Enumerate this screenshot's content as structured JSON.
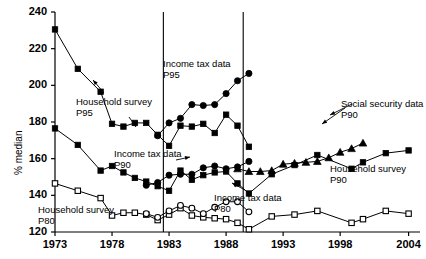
{
  "chart_data": {
    "type": "line",
    "title": "",
    "xlabel": "",
    "ylabel": "% median",
    "xlim": [
      1973,
      2005
    ],
    "ylim": [
      120,
      240
    ],
    "ytick_values": [
      120,
      140,
      160,
      180,
      200,
      220,
      240
    ],
    "ytick_labels": [
      "120",
      "140",
      "160",
      "180",
      "200",
      "220",
      "240"
    ],
    "xtick_values": [
      1973,
      1978,
      1983,
      1988,
      1993,
      1998,
      2004
    ],
    "xtick_labels": [
      "1973",
      "1978",
      "1983",
      "1988",
      "1993",
      "1998",
      "2004"
    ],
    "grid": false,
    "legend_position": "inline-annotations",
    "vertical_reference_lines": [
      1982.5,
      1989.5
    ],
    "series": [
      {
        "name": "Household survey P95",
        "marker": "filled-square",
        "x": [
          1973,
          1975,
          1977,
          1978,
          1979,
          1980,
          1981,
          1982,
          1983,
          1984,
          1985,
          1986,
          1987,
          1988,
          1989,
          1990
        ],
        "values": [
          230.5,
          209.0,
          196.5,
          179.0,
          177.5,
          179.5,
          179.5,
          173.0,
          167.0,
          178.0,
          177.5,
          179.0,
          174.0,
          184.0,
          178.0,
          166.5
        ]
      },
      {
        "name": "Income tax data P95",
        "marker": "filled-circle",
        "x": [
          1982,
          1983,
          1984,
          1985,
          1986,
          1987,
          1988,
          1989,
          1990
        ],
        "values": [
          172.5,
          179.5,
          182.0,
          189.5,
          189.0,
          189.5,
          195.5,
          202.5,
          206.5
        ]
      },
      {
        "name": "Household survey P90",
        "marker": "filled-square",
        "x": [
          1973,
          1975,
          1977,
          1978,
          1979,
          1980,
          1981,
          1982,
          1983,
          1984,
          1985,
          1986,
          1987,
          1988,
          1989,
          1990,
          1992,
          1994,
          1996,
          1999,
          2000,
          2002,
          2004
        ],
        "values": [
          176.5,
          167.5,
          153.5,
          156.0,
          152.5,
          149.5,
          147.5,
          145.0,
          142.5,
          153.5,
          148.5,
          151.0,
          152.5,
          153.0,
          146.5,
          141.0,
          151.5,
          156.5,
          162.0,
          154.5,
          158.0,
          163.0,
          164.5
        ]
      },
      {
        "name": "Income tax data P90",
        "marker": "filled-circle",
        "x": [
          1981,
          1982,
          1983,
          1984,
          1985,
          1986,
          1987,
          1988,
          1989,
          1990
        ],
        "values": [
          145.5,
          147.0,
          151.0,
          151.5,
          151.5,
          155.0,
          156.0,
          154.5,
          155.5,
          158.5
        ]
      },
      {
        "name": "Social security data P90",
        "marker": "filled-triangle",
        "x": [
          1989,
          1990,
          1991,
          1992,
          1993,
          1994,
          1995,
          1996,
          1997,
          1998,
          1999,
          2000
        ],
        "values": [
          154.5,
          153.0,
          153.0,
          153.5,
          157.0,
          157.5,
          158.0,
          158.5,
          160.5,
          163.5,
          165.5,
          168.5
        ]
      },
      {
        "name": "Household survey P80",
        "marker": "open-square",
        "x": [
          1973,
          1975,
          1977,
          1978,
          1979,
          1980,
          1981,
          1982,
          1983,
          1984,
          1985,
          1986,
          1987,
          1988,
          1989,
          1990,
          1992,
          1994,
          1996,
          1999,
          2000,
          2002,
          2004
        ],
        "values": [
          146.5,
          142.5,
          138.5,
          129.0,
          130.5,
          130.5,
          129.5,
          126.5,
          129.5,
          133.0,
          129.0,
          128.0,
          127.5,
          127.0,
          125.0,
          121.5,
          128.5,
          129.5,
          131.5,
          125.0,
          127.0,
          131.5,
          130.0
        ]
      },
      {
        "name": "Income tax data P80",
        "marker": "open-circle",
        "x": [
          1981,
          1982,
          1983,
          1984,
          1985,
          1986,
          1987,
          1988,
          1989,
          1990
        ],
        "values": [
          130.0,
          128.0,
          131.5,
          134.5,
          133.0,
          130.0,
          133.5,
          136.5,
          136.5,
          131.0
        ]
      }
    ],
    "annotations": [
      {
        "id": "household-survey-p95",
        "text": "Household survey\nP95"
      },
      {
        "id": "income-tax-data-p95",
        "text": "Income tax data\nP95"
      },
      {
        "id": "income-tax-data-p90",
        "text": "Income tax data\nP90"
      },
      {
        "id": "household-survey-p80",
        "text": "Household survey\nP80"
      },
      {
        "id": "income-tax-data-p80",
        "text": "Income tax data\nP80"
      },
      {
        "id": "social-security-p90",
        "text": "Social security data\nP90"
      },
      {
        "id": "household-survey-p90",
        "text": "Household survey\nP90"
      }
    ],
    "colors": {
      "line": "#000000",
      "marker_fill": "#000000",
      "axis": "#000000",
      "background": "#ffffff"
    }
  }
}
